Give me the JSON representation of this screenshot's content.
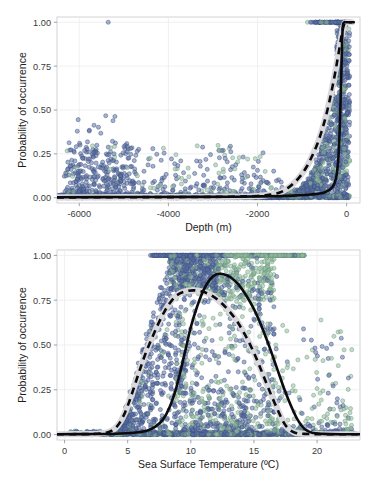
{
  "figure": {
    "title": "",
    "panel_count": 2
  },
  "chart_data": [
    {
      "id": "depth-panel",
      "type": "scatter",
      "title": "",
      "xlabel": "Depth (m)",
      "ylabel": "Probability of occurrence",
      "xlim": [
        -6500,
        300
      ],
      "ylim": [
        -0.03,
        1.03
      ],
      "xticks": [
        -6000,
        -4000,
        -2000,
        0
      ],
      "xticklabels": [
        "-6000",
        "-4000",
        "-2000",
        "0"
      ],
      "yticks": [
        0.0,
        0.25,
        0.5,
        0.75,
        1.0
      ],
      "yticklabels": [
        "0.00",
        "0.25",
        "0.50",
        "0.75",
        "1.00"
      ],
      "grid": true,
      "legend": "none",
      "series": [
        {
          "name": "model-a-points",
          "color": "#5d72a6",
          "stroke": "#3d4f80",
          "marker": "circle",
          "opacity": 0.78
        },
        {
          "name": "model-b-points",
          "color": "#93bba1",
          "stroke": "#6d9a7e",
          "marker": "circle",
          "opacity": 0.78
        }
      ],
      "fits": [
        {
          "name": "solid-fit",
          "style": "solid",
          "color": "#0b0b0f",
          "description": "Near-zero across most depths, rises abruptly to 1.00 very close to 0 m",
          "points": [
            [
              -6500,
              0.003
            ],
            [
              -5000,
              0.004
            ],
            [
              -3500,
              0.005
            ],
            [
              -2500,
              0.006
            ],
            [
              -1800,
              0.008
            ],
            [
              -1200,
              0.012
            ],
            [
              -800,
              0.018
            ],
            [
              -500,
              0.03
            ],
            [
              -320,
              0.06
            ],
            [
              -240,
              0.11
            ],
            [
              -190,
              0.21
            ],
            [
              -160,
              0.36
            ],
            [
              -140,
              0.52
            ],
            [
              -120,
              0.7
            ],
            [
              -105,
              0.86
            ],
            [
              -92,
              0.95
            ],
            [
              -80,
              0.99
            ],
            [
              -50,
              1.0
            ],
            [
              0,
              1.0
            ],
            [
              160,
              1.0
            ]
          ]
        },
        {
          "name": "dashed-fit",
          "style": "dashed",
          "color": "#0b0b0f",
          "halo": "#d9d9dd",
          "description": "Gradual sigmoid rise beginning near -1500 m, reaching 1.00 near -30 m",
          "points": [
            [
              -6500,
              0.002
            ],
            [
              -5000,
              0.003
            ],
            [
              -3500,
              0.004
            ],
            [
              -2600,
              0.006
            ],
            [
              -2000,
              0.01
            ],
            [
              -1700,
              0.018
            ],
            [
              -1500,
              0.03
            ],
            [
              -1350,
              0.05
            ],
            [
              -1200,
              0.08
            ],
            [
              -1050,
              0.12
            ],
            [
              -900,
              0.175
            ],
            [
              -780,
              0.235
            ],
            [
              -660,
              0.305
            ],
            [
              -560,
              0.38
            ],
            [
              -470,
              0.46
            ],
            [
              -390,
              0.545
            ],
            [
              -320,
              0.63
            ],
            [
              -255,
              0.715
            ],
            [
              -200,
              0.795
            ],
            [
              -150,
              0.87
            ],
            [
              -110,
              0.93
            ],
            [
              -75,
              0.972
            ],
            [
              -45,
              0.993
            ],
            [
              -15,
              1.0
            ],
            [
              120,
              1.0
            ]
          ]
        }
      ],
      "scatter_clusters": [
        {
          "note": "dense low-probability band along y=0 spanning full depth range"
        },
        {
          "note": "diffuse blue cloud 0.05-0.25 between -6200 and -4800 m"
        },
        {
          "note": "isolated blue point at (-5350, 1.00)"
        },
        {
          "note": "scattered blue/green points 0.05-0.35 between -4000 and -1500 m"
        },
        {
          "note": "dense rising cloud 0.00-1.00 between -1200 and 0 m"
        },
        {
          "note": "saturated band at y=1.00 from about -900 to 0 m"
        }
      ]
    },
    {
      "id": "sst-panel",
      "type": "scatter",
      "title": "",
      "xlabel": "Sea Surface Temperature (ºC)",
      "ylabel": "Probability of occurrence",
      "xlim": [
        -0.6,
        23.4
      ],
      "ylim": [
        -0.03,
        1.03
      ],
      "xticks": [
        0,
        5,
        10,
        15,
        20
      ],
      "xticklabels": [
        "0",
        "5",
        "10",
        "15",
        "20"
      ],
      "yticks": [
        0.0,
        0.25,
        0.5,
        0.75,
        1.0
      ],
      "yticklabels": [
        "0.00",
        "0.25",
        "0.50",
        "0.75",
        "1.00"
      ],
      "grid": true,
      "legend": "none",
      "series": [
        {
          "name": "model-a-points",
          "color": "#5d72a6",
          "stroke": "#3d4f80",
          "marker": "circle",
          "opacity": 0.78
        },
        {
          "name": "model-b-points",
          "color": "#93bba1",
          "stroke": "#6d9a7e",
          "marker": "circle",
          "opacity": 0.78
        }
      ],
      "fits": [
        {
          "name": "solid-fit",
          "style": "solid",
          "color": "#0b0b0f",
          "description": "Unimodal bell peaking at about 0.90 near 12 ºC, rising from 7 ºC and falling to 0 by 19 ºC",
          "points": [
            [
              -0.6,
              0.002
            ],
            [
              2.0,
              0.003
            ],
            [
              4.0,
              0.005
            ],
            [
              5.5,
              0.01
            ],
            [
              6.5,
              0.022
            ],
            [
              7.2,
              0.045
            ],
            [
              7.8,
              0.085
            ],
            [
              8.3,
              0.15
            ],
            [
              8.8,
              0.25
            ],
            [
              9.2,
              0.36
            ],
            [
              9.6,
              0.48
            ],
            [
              10.0,
              0.6
            ],
            [
              10.5,
              0.715
            ],
            [
              11.0,
              0.805
            ],
            [
              11.5,
              0.865
            ],
            [
              12.0,
              0.893
            ],
            [
              12.6,
              0.895
            ],
            [
              13.2,
              0.875
            ],
            [
              13.8,
              0.835
            ],
            [
              14.4,
              0.775
            ],
            [
              15.0,
              0.7
            ],
            [
              15.6,
              0.605
            ],
            [
              16.2,
              0.495
            ],
            [
              16.8,
              0.375
            ],
            [
              17.4,
              0.255
            ],
            [
              18.0,
              0.15
            ],
            [
              18.5,
              0.078
            ],
            [
              19.0,
              0.032
            ],
            [
              19.6,
              0.01
            ],
            [
              20.5,
              0.004
            ],
            [
              22.0,
              0.002
            ],
            [
              23.4,
              0.002
            ]
          ]
        },
        {
          "name": "dashed-fit",
          "style": "dashed",
          "color": "#0b0b0f",
          "halo": "#d9d9dd",
          "description": "Broader plateau peaking near 0.80 between 9 and 11 ºC, rising from 3.5 ºC and falling to 0 by 17.5 ºC",
          "points": [
            [
              -0.6,
              0.002
            ],
            [
              1.5,
              0.003
            ],
            [
              2.8,
              0.006
            ],
            [
              3.5,
              0.015
            ],
            [
              4.0,
              0.035
            ],
            [
              4.4,
              0.07
            ],
            [
              4.8,
              0.125
            ],
            [
              5.2,
              0.2
            ],
            [
              5.6,
              0.285
            ],
            [
              6.0,
              0.37
            ],
            [
              6.4,
              0.45
            ],
            [
              6.9,
              0.535
            ],
            [
              7.4,
              0.615
            ],
            [
              7.9,
              0.685
            ],
            [
              8.4,
              0.74
            ],
            [
              8.9,
              0.778
            ],
            [
              9.5,
              0.798
            ],
            [
              10.2,
              0.805
            ],
            [
              10.9,
              0.798
            ],
            [
              11.6,
              0.778
            ],
            [
              12.3,
              0.742
            ],
            [
              13.0,
              0.692
            ],
            [
              13.7,
              0.628
            ],
            [
              14.3,
              0.556
            ],
            [
              14.9,
              0.472
            ],
            [
              15.4,
              0.39
            ],
            [
              15.9,
              0.302
            ],
            [
              16.4,
              0.215
            ],
            [
              16.9,
              0.135
            ],
            [
              17.3,
              0.075
            ],
            [
              17.7,
              0.035
            ],
            [
              18.2,
              0.012
            ],
            [
              19.0,
              0.004
            ],
            [
              21.0,
              0.002
            ],
            [
              23.4,
              0.002
            ]
          ]
        }
      ],
      "scatter_clusters": [
        {
          "note": "dense low-probability band along y=0 spanning 0.5 to 23 ºC"
        },
        {
          "note": "saturated band at y=1.00 from about 7 to 19 ºC, blue left of 13, green right of 13"
        },
        {
          "note": "steep blue cloud spanning 0.10-1.00 between 5 and 9 ºC"
        },
        {
          "note": "mixed blue/green mid-probability cloud 0.2-0.9 between 9 and 16 ºC"
        },
        {
          "note": "sparse green points 0.05-0.60 between 16 and 22 ºC"
        }
      ]
    }
  ]
}
